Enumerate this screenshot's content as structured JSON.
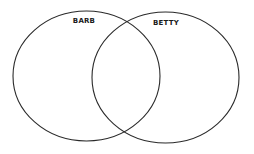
{
  "diagram": {
    "type": "venn",
    "stroke_color": "#2a2a2a",
    "background": "#ffffff",
    "sets": [
      {
        "label": "BARB",
        "cx": 86.5,
        "cy": 76,
        "rx": 73.5,
        "ry": 65
      },
      {
        "label": "BETTY",
        "cx": 165.5,
        "cy": 77.5,
        "rx": 73.5,
        "ry": 65.5
      }
    ]
  }
}
